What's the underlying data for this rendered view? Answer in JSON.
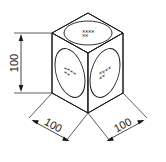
{
  "drawing": {
    "title": "Isometric cube dimension drawing",
    "object_name": "cube",
    "line_color": "#1a1a1a",
    "background_color": "#ffffff"
  },
  "dimensions": {
    "height": {
      "label": "100",
      "name": "vertical-height-dimension",
      "orientation": "vertical"
    },
    "left_depth": {
      "label": "100",
      "name": "left-depth-dimension",
      "orientation": "isometric-left"
    },
    "right_width": {
      "label": "100",
      "name": "right-width-dimension",
      "orientation": "isometric-right"
    }
  },
  "faces": {
    "top": {
      "name": "top-face",
      "marking_shape": "ellipse",
      "marking_text_line1": "✕✕✕✕",
      "marking_text_line2": "✕✕"
    },
    "left": {
      "name": "left-face",
      "marking_shape": "ellipse",
      "marking_text_line1": "✕✕✕✕",
      "marking_text_line2": "✕✕"
    },
    "right": {
      "name": "right-face",
      "marking_shape": "ellipse",
      "marking_text_line1": "✕✕✕✕",
      "marking_text_line2": "✕✕"
    }
  }
}
